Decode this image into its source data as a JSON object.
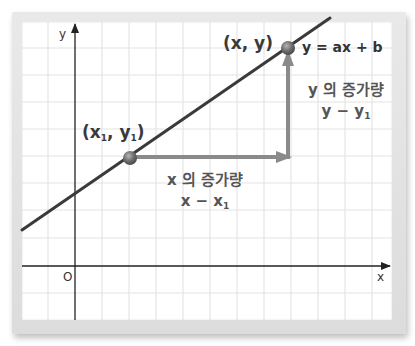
{
  "diagram": {
    "axes": {
      "x_label": "x",
      "y_label": "y",
      "origin_label": "O"
    },
    "line": {
      "equation_label": "y = ax + b",
      "color": "#3a3a3a"
    },
    "points": {
      "p1": {
        "label_main": "(x",
        "label_sub1": "1",
        "label_mid": ", y",
        "label_sub2": "1",
        "label_end": ")"
      },
      "p2": {
        "label": "(x, y)"
      }
    },
    "x_increase": {
      "title": "x 의 증가량",
      "expr_main": "x − x",
      "expr_sub": "1"
    },
    "y_increase": {
      "title": "y 의 증가량",
      "expr_main": "y − y",
      "expr_sub": "1"
    },
    "colors": {
      "grid": "#e4e4e4",
      "axis": "#222222",
      "arrow": "#8a8a8a",
      "point": "#6e6e6e",
      "frame": "#dedede"
    }
  }
}
